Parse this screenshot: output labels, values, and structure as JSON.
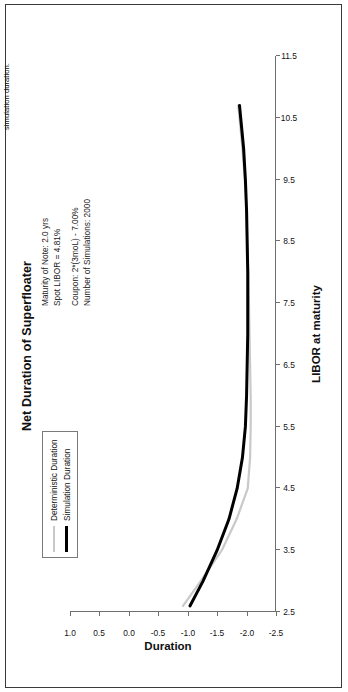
{
  "figure": {
    "footer_note": "simulation duration.",
    "title": "Net Duration of Superfloater"
  },
  "annotations": {
    "line1": "Maturity of Note: 2.0 yrs",
    "line2": "Spot LIBOR = 4.81%",
    "line3": "Coupon: 2*(3moL) - 7.00%",
    "line4": "Number of Simulations: 2000"
  },
  "legend": {
    "items": [
      {
        "label": "Deterministic Duration",
        "color": "#c9c9c9"
      },
      {
        "label": "Simulation Duration",
        "color": "#000000"
      }
    ]
  },
  "chart_data": {
    "type": "line",
    "title": "Net Duration of Superfloater",
    "xlabel": "LIBOR at maturity",
    "ylabel": "Duration",
    "xlim": [
      2.5,
      11.5
    ],
    "ylim": [
      -2.5,
      1.0
    ],
    "xticks": [
      "2.5",
      "3.5",
      "4.5",
      "5.5",
      "6.5",
      "7.5",
      "8.5",
      "9.5",
      "10.5",
      "11.5"
    ],
    "yticks": [
      "1.0",
      "0.5",
      "0.0",
      "-0.5",
      "-1.0",
      "-1.5",
      "-2.0",
      "-2.5"
    ],
    "grid": false,
    "legend_position": "upper-left",
    "x": [
      2.6,
      3.0,
      3.5,
      4.0,
      4.5,
      5.0,
      5.5,
      6.0,
      6.5,
      7.0,
      7.5,
      8.0,
      8.5,
      9.0,
      9.5,
      10.0,
      10.5,
      10.7
    ],
    "series": [
      {
        "name": "Deterministic Duration",
        "color": "#c9c9c9",
        "values": [
          -0.92,
          -1.22,
          -1.58,
          -1.83,
          -2.02,
          -2.06,
          -2.07,
          -2.07,
          -2.06,
          -2.05,
          -2.04,
          -2.03,
          -2.01,
          -2.0,
          -1.97,
          -1.93,
          -1.88,
          -1.86
        ]
      },
      {
        "name": "Simulation Duration",
        "color": "#000000",
        "values": [
          -1.04,
          -1.26,
          -1.5,
          -1.7,
          -1.84,
          -1.93,
          -1.98,
          -2.0,
          -2.01,
          -2.02,
          -2.02,
          -2.02,
          -2.01,
          -2.0,
          -1.98,
          -1.95,
          -1.9,
          -1.88
        ]
      }
    ]
  }
}
